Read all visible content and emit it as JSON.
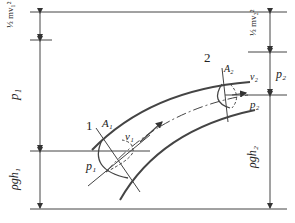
{
  "diagram": {
    "section_labels": {
      "s1": "1",
      "s2": "2"
    },
    "area_labels": {
      "a1": "A",
      "a1_sub": "1",
      "a2": "A",
      "a2_sub": "2"
    },
    "velocity_labels": {
      "v1": "v",
      "v1_sub": "1",
      "v2": "v",
      "v2_sub": "2"
    },
    "pressure_labels": {
      "p1_inner": "p",
      "p1_sub": "1",
      "p2_inner": "p",
      "p2_sub": "2"
    },
    "left_dimensions": {
      "kinetic": "½mv₁²",
      "pressure": "p₁",
      "potential": "ρgh₁"
    },
    "right_dimensions": {
      "kinetic": "½mv₂²",
      "pressure": "p₂",
      "potential": "ρgh₂"
    },
    "colors": {
      "line": "#333333",
      "background": "#ffffff"
    }
  }
}
